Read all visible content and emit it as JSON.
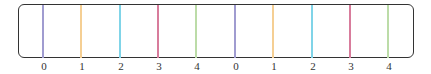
{
  "diagram": {
    "title": "",
    "frame": {
      "border_color": "#333333"
    },
    "ticks": [
      {
        "label": "0",
        "x": 43,
        "color": "#a09cd0"
      },
      {
        "label": "1",
        "x": 81,
        "color": "#f5cf94"
      },
      {
        "label": "2",
        "x": 120,
        "color": "#80d4e8"
      },
      {
        "label": "3",
        "x": 158,
        "color": "#d87c9c"
      },
      {
        "label": "4",
        "x": 196,
        "color": "#bcdca8"
      },
      {
        "label": "0",
        "x": 235,
        "color": "#a09cd0"
      },
      {
        "label": "1",
        "x": 273,
        "color": "#f5cf94"
      },
      {
        "label": "2",
        "x": 312,
        "color": "#80d4e8"
      },
      {
        "label": "3",
        "x": 350,
        "color": "#d87c9c"
      },
      {
        "label": "4",
        "x": 388,
        "color": "#bcdca8"
      }
    ]
  }
}
